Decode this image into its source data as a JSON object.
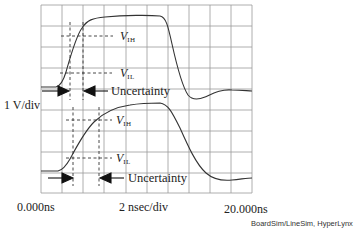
{
  "figure": {
    "type": "oscilloscope-waveform-diagram",
    "y_scale_label": "1 V/div",
    "x_scale_label": "2 nsec/div",
    "x_start_label": "0.000ns",
    "x_end_label": "20.000ns",
    "credit": "BoardSim/LineSim, HyperLynx",
    "grid": {
      "columns": 10,
      "rows": 9,
      "color": "#9a9a9a"
    },
    "trace_color": "#333333",
    "upper_trace": {
      "vih_label": "V",
      "vih_sub": "IH",
      "vil_label": "V",
      "vil_sub": "IL",
      "uncertainty_label": "Uncertainty"
    },
    "lower_trace": {
      "vih_label": "V",
      "vih_sub": "IH",
      "vil_label": "V",
      "vil_sub": "IL",
      "uncertainty_label": "Uncertainty"
    }
  }
}
